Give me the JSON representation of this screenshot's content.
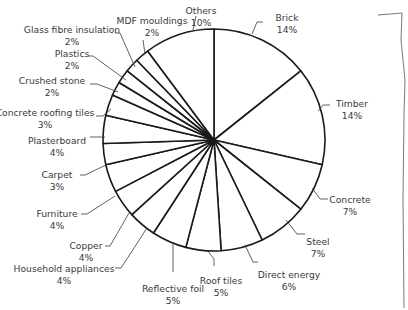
{
  "chart_data": {
    "type": "pie",
    "title": "",
    "start_angle_deg": 0,
    "direction": "clockwise",
    "center": [
      214,
      140
    ],
    "radius": 111,
    "slices": [
      {
        "label": "Brick",
        "value": 14,
        "pct": "14%",
        "lx": 287,
        "ly": 14,
        "anchor": "middle",
        "leader": [
          [
            252,
            34
          ],
          [
            257,
            22
          ],
          [
            263,
            22
          ]
        ]
      },
      {
        "label": "Timber",
        "value": 14,
        "pct": "14%",
        "lx": 352,
        "ly": 100,
        "anchor": "middle",
        "leader": [
          [
            318,
            111
          ],
          [
            323,
            105
          ],
          [
            330,
            105
          ]
        ]
      },
      {
        "label": "Concrete",
        "value": 7,
        "pct": "7%",
        "lx": 350,
        "ly": 196,
        "anchor": "middle",
        "leader": [
          [
            312,
            188
          ],
          [
            320,
            199
          ],
          [
            328,
            199
          ]
        ]
      },
      {
        "label": "Steel",
        "value": 7,
        "pct": "7%",
        "lx": 318,
        "ly": 238,
        "anchor": "middle",
        "leader": [
          [
            286,
            220
          ],
          [
            297,
            234
          ],
          [
            305,
            234
          ]
        ]
      },
      {
        "label": "Direct energy",
        "value": 6,
        "pct": "6%",
        "lx": 289,
        "ly": 271,
        "anchor": "middle",
        "leader": [
          [
            245,
            245
          ],
          [
            253,
            262
          ],
          [
            258,
            262
          ]
        ]
      },
      {
        "label": "Roof tiles",
        "value": 5,
        "pct": "5%",
        "lx": 221,
        "ly": 277,
        "anchor": "middle",
        "leader": [
          [
            207,
            250
          ],
          [
            214,
            259
          ],
          [
            214,
            266
          ]
        ]
      },
      {
        "label": "Reflective foil",
        "value": 5,
        "pct": "5%",
        "lx": 173,
        "ly": 285,
        "anchor": "middle",
        "leader": [
          [
            173,
            243
          ],
          [
            173,
            272
          ]
        ]
      },
      {
        "label": "Household appliances",
        "value": 4,
        "pct": "4%",
        "lx": 64,
        "ly": 265,
        "anchor": "middle",
        "leader": [
          [
            147,
            228
          ],
          [
            121,
            268
          ],
          [
            115,
            268
          ]
        ]
      },
      {
        "label": "Copper",
        "value": 4,
        "pct": "4%",
        "lx": 86,
        "ly": 242,
        "anchor": "middle",
        "leader": [
          [
            129,
            213
          ],
          [
            110,
            246
          ],
          [
            105,
            246
          ]
        ]
      },
      {
        "label": "Furniture",
        "value": 4,
        "pct": "4%",
        "lx": 57,
        "ly": 210,
        "anchor": "middle",
        "leader": [
          [
            115,
            196
          ],
          [
            87,
            214
          ],
          [
            81,
            214
          ]
        ]
      },
      {
        "label": "Carpet",
        "value": 3,
        "pct": "3%",
        "lx": 57,
        "ly": 171,
        "anchor": "middle",
        "leader": [
          [
            108,
            164
          ],
          [
            85,
            175
          ],
          [
            80,
            175
          ]
        ]
      },
      {
        "label": "Plasterboard",
        "value": 4,
        "pct": "4%",
        "lx": 57,
        "ly": 137,
        "anchor": "middle",
        "leader": [
          [
            105,
            137
          ],
          [
            90,
            137
          ]
        ]
      },
      {
        "label": "Concrete roofing tiles",
        "value": 3,
        "pct": "3%",
        "lx": 45,
        "ly": 109,
        "anchor": "middle",
        "leader": [
          [
            111,
            109
          ],
          [
            103,
            116
          ],
          [
            96,
            116
          ]
        ]
      },
      {
        "label": "Crushed stone",
        "value": 2,
        "pct": "2%",
        "lx": 52,
        "ly": 77,
        "anchor": "middle",
        "leader": [
          [
            118,
            92
          ],
          [
            97,
            84
          ],
          [
            90,
            84
          ]
        ]
      },
      {
        "label": "Plastics",
        "value": 2,
        "pct": "2%",
        "lx": 72,
        "ly": 50,
        "anchor": "middle",
        "leader": [
          [
            126,
            80
          ],
          [
            93,
            56
          ],
          [
            88,
            56
          ]
        ]
      },
      {
        "label": "Glass fibre insulation",
        "value": 2,
        "pct": "2%",
        "lx": 72,
        "ly": 26,
        "anchor": "middle",
        "leader": [
          [
            135,
            67
          ],
          [
            120,
            33
          ],
          [
            115,
            33
          ]
        ]
      },
      {
        "label": "MDF mouldings",
        "value": 2,
        "pct": "2%",
        "lx": 152,
        "ly": 17,
        "anchor": "middle",
        "leader": [
          [
            145,
            54
          ],
          [
            143,
            40
          ]
        ]
      },
      {
        "label": "Others",
        "value": 10,
        "pct": "10%",
        "lx": 201,
        "ly": 7,
        "anchor": "middle",
        "leader": [
          [
            193,
            30
          ],
          [
            196,
            16
          ]
        ]
      }
    ],
    "total": 98,
    "xlabel": "",
    "ylabel": "",
    "legend": "none (direct labels)"
  },
  "colors": {
    "slice_fill": "#ffffff",
    "slice_stroke": "#1a1a1a",
    "label_text": "#3a3a3a",
    "leader_line": "#3a3a3a"
  }
}
